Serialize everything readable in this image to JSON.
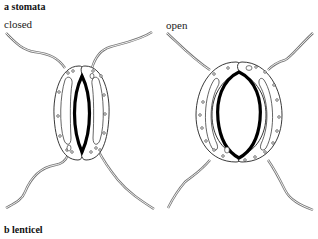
{
  "section_a": {
    "title": "a stomata"
  },
  "section_b": {
    "title": "b lenticel"
  },
  "diagrams": [
    {
      "label": "closed",
      "state": "closed"
    },
    {
      "label": "open",
      "state": "open"
    }
  ],
  "colors": {
    "outline": "#222222",
    "pore": "#000000",
    "wall_lines": "#777777",
    "background": "#ffffff"
  }
}
